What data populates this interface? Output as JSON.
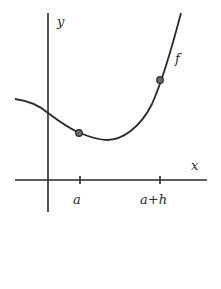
{
  "diagram": {
    "title": "",
    "axes": {
      "x_label": "x",
      "y_label": "y"
    },
    "curve": {
      "label": "f"
    },
    "ticks": [
      {
        "label": "a"
      },
      {
        "label": "a+h"
      }
    ],
    "points": [
      {
        "name": "point-at-a"
      },
      {
        "name": "point-at-a-plus-h"
      }
    ],
    "colors": {
      "stroke": "#2a2a2a",
      "point_fill": "#6b6b6b",
      "background": "#ffffff"
    }
  }
}
